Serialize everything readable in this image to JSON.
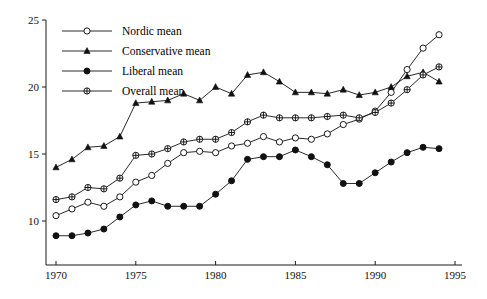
{
  "chart_data": {
    "type": "line",
    "title": "",
    "xlabel": "",
    "ylabel": "",
    "xlim": [
      1969.2,
      1995.4
    ],
    "ylim": [
      8.0,
      25.4
    ],
    "xticks": [
      1970,
      1975,
      1980,
      1985,
      1990,
      1995
    ],
    "yticks": [
      10,
      15,
      20,
      25
    ],
    "grid": false,
    "legend_position": "top-left",
    "x": [
      1970,
      1971,
      1972,
      1973,
      1974,
      1975,
      1976,
      1977,
      1978,
      1979,
      1980,
      1981,
      1982,
      1983,
      1984,
      1985,
      1986,
      1987,
      1988,
      1989,
      1990,
      1991,
      1992,
      1993,
      1994
    ],
    "series": [
      {
        "name": "Nordic mean",
        "marker": "open-circle",
        "values": [
          10.4,
          10.9,
          11.4,
          11.1,
          11.8,
          12.9,
          13.4,
          14.3,
          15.1,
          15.2,
          15.1,
          15.6,
          15.8,
          16.3,
          15.9,
          16.2,
          16.1,
          16.5,
          17.2,
          17.6,
          18.2,
          19.6,
          21.3,
          22.9,
          23.9
        ]
      },
      {
        "name": "Conservative mean",
        "marker": "filled-triangle",
        "values": [
          14.0,
          14.6,
          15.5,
          15.6,
          16.3,
          18.8,
          18.9,
          19.0,
          19.5,
          19.0,
          20.0,
          19.5,
          20.9,
          21.1,
          20.4,
          19.6,
          19.6,
          19.5,
          19.8,
          19.4,
          19.6,
          20.0,
          20.8,
          21.1,
          20.4
        ]
      },
      {
        "name": "Liberal mean",
        "marker": "filled-circle",
        "values": [
          8.9,
          8.9,
          9.1,
          9.4,
          10.3,
          11.2,
          11.5,
          11.1,
          11.1,
          11.1,
          12.0,
          13.0,
          14.6,
          14.8,
          14.8,
          15.3,
          14.8,
          14.2,
          12.8,
          12.8,
          13.6,
          14.4,
          15.1,
          15.5,
          15.4
        ]
      },
      {
        "name": "Overall mean",
        "marker": "crossed-circle",
        "values": [
          11.6,
          11.8,
          12.5,
          12.4,
          13.2,
          14.9,
          15.0,
          15.4,
          15.9,
          16.1,
          16.1,
          16.6,
          17.4,
          17.9,
          17.7,
          17.7,
          17.7,
          17.8,
          17.9,
          17.7,
          18.1,
          18.8,
          19.8,
          20.9,
          21.5
        ]
      }
    ]
  },
  "legend": {
    "items": [
      {
        "label": "Nordic mean",
        "marker": "open-circle"
      },
      {
        "label": "Conservative mean",
        "marker": "filled-triangle"
      },
      {
        "label": "Liberal mean",
        "marker": "filled-circle"
      },
      {
        "label": "Overall mean",
        "marker": "crossed-circle"
      }
    ]
  },
  "axes": {
    "x_tick_labels": [
      "1970",
      "1975",
      "1980",
      "1985",
      "1990",
      "1995"
    ],
    "y_tick_labels": [
      "10",
      "15",
      "20",
      "25"
    ]
  }
}
